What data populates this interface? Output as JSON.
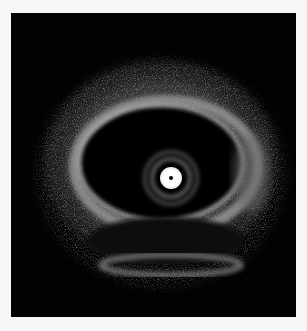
{
  "image": {
    "type": "intravascular ultrasound cross-section",
    "background": "#f6f6f6",
    "frame_color": "#020202",
    "frame": {
      "x": 11,
      "y": 13,
      "width": 285,
      "height": 304
    },
    "catheter_center": {
      "x": 171,
      "y": 178
    }
  }
}
